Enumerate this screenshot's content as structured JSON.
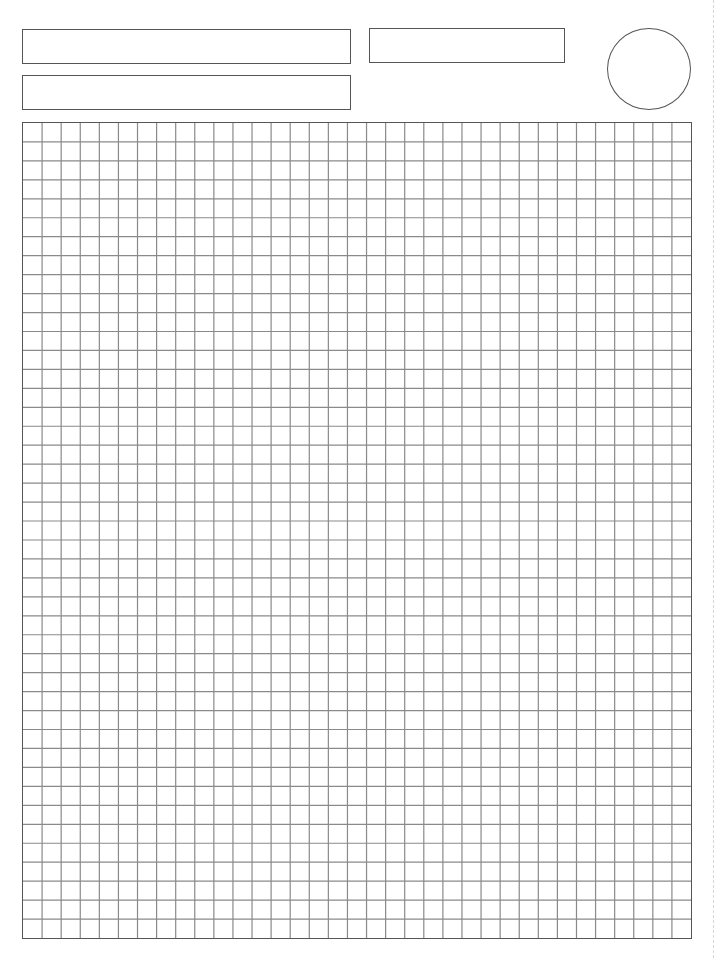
{
  "page": {
    "type": "graph-paper-worksheet",
    "background": "#ffffff",
    "line_color": "#555555",
    "grid_line_color": "#8a8a8a"
  },
  "header": {
    "fields": [
      {
        "name": "field-top-left",
        "value": ""
      },
      {
        "name": "field-bottom-left",
        "value": ""
      },
      {
        "name": "field-top-right",
        "value": ""
      }
    ],
    "circle_field": {
      "value": ""
    }
  },
  "grid": {
    "columns": 35,
    "rows": 43
  }
}
